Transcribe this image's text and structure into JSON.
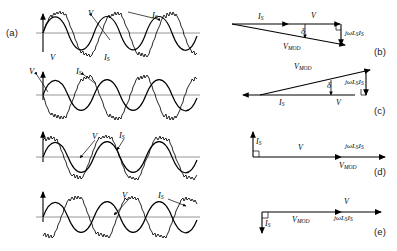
{
  "figure": {
    "background_color": "#ffffff",
    "line_color": "#000000",
    "axis_color": "#808080",
    "width": 397,
    "height": 251
  },
  "panels": [
    {
      "id": "a",
      "label": "(a)",
      "type": "waveform",
      "waveform_labels": [
        {
          "name": "voltage-label-top",
          "text": "V"
        },
        {
          "name": "current-label-top",
          "text": "I",
          "sub": "S"
        },
        {
          "name": "voltage-label-bottom",
          "text": "V"
        },
        {
          "name": "current-label-bottom",
          "text": "I",
          "sub": "S"
        }
      ],
      "description": "Smooth sinusoidal voltage V in phase with chopped/rippled current I_S"
    },
    {
      "id": "b",
      "label": "(b)",
      "type": "phasor",
      "phasors": [
        {
          "name": "current-phasor",
          "text": "I",
          "sub": "S"
        },
        {
          "name": "voltage-phasor",
          "text": "V"
        },
        {
          "name": "modulated-voltage-phasor",
          "text": "V",
          "sub": "MOD"
        },
        {
          "name": "inductive-drop-phasor",
          "text": "jωL",
          "sub": "S",
          "text2": "I",
          "sub2": "S"
        },
        {
          "name": "delta-angle",
          "text": "δ"
        }
      ]
    },
    {
      "id": "c",
      "label": "(c)",
      "type": "waveform-and-phasor",
      "waveform_labels": [
        {
          "name": "voltage-label",
          "text": "V"
        },
        {
          "name": "current-label",
          "text": "I",
          "sub": "S"
        }
      ],
      "phasors": [
        {
          "name": "current-phasor",
          "text": "I",
          "sub": "S"
        },
        {
          "name": "voltage-phasor",
          "text": "V"
        },
        {
          "name": "modulated-voltage-phasor",
          "text": "V",
          "sub": "MOD"
        },
        {
          "name": "inductive-drop-phasor",
          "text": "jωL",
          "sub": "S",
          "text2": "I",
          "sub2": "S"
        },
        {
          "name": "delta-angle",
          "text": "δ"
        }
      ],
      "description": "Voltage V and current I_S in antiphase (180 degrees)"
    },
    {
      "id": "d",
      "label": "(d)",
      "type": "waveform-and-phasor",
      "waveform_labels": [
        {
          "name": "voltage-label",
          "text": "V"
        },
        {
          "name": "current-label",
          "text": "I",
          "sub": "S"
        }
      ],
      "phasors": [
        {
          "name": "current-phasor",
          "text": "I",
          "sub": "S"
        },
        {
          "name": "voltage-phasor",
          "text": "V"
        },
        {
          "name": "modulated-voltage-phasor",
          "text": "V",
          "sub": "MOD"
        },
        {
          "name": "inductive-drop-phasor",
          "text": "jωL",
          "sub": "S",
          "text2": "I",
          "sub2": "S"
        }
      ],
      "description": "Current I_S leads voltage V by 90 degrees; capacitive VAR operation"
    },
    {
      "id": "e",
      "label": "(e)",
      "type": "waveform-and-phasor",
      "waveform_labels": [
        {
          "name": "voltage-label",
          "text": "V"
        },
        {
          "name": "current-label",
          "text": "I",
          "sub": "S"
        }
      ],
      "phasors": [
        {
          "name": "current-phasor",
          "text": "I",
          "sub": "S"
        },
        {
          "name": "voltage-phasor",
          "text": "V"
        },
        {
          "name": "modulated-voltage-phasor",
          "text": "V",
          "sub": "MOD"
        },
        {
          "name": "inductive-drop-phasor",
          "text": "jωL",
          "sub": "S",
          "text2": "I",
          "sub2": "S"
        }
      ],
      "description": "Current I_S lags voltage V by 90 degrees; inductive VAR operation"
    }
  ],
  "symbols": {
    "voltage": "V",
    "source_current": "I_S",
    "modulated_voltage": "V_MOD",
    "inductive_drop": "jωL_S I_S",
    "phase_angle": "δ",
    "omega": "ω"
  }
}
